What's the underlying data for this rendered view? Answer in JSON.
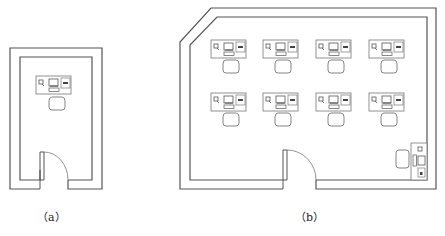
{
  "figure": {
    "panels": [
      {
        "id": "a",
        "label": "（a）",
        "description": "Single-occupant room floor plan with one workstation and a hinged door at bottom",
        "workstations": 1,
        "door": "bottom-left, swing inward-right"
      },
      {
        "id": "b",
        "label": "（b）",
        "description": "Multi-occupant room floor plan with chamfered top-left corner, 8 workstations in 2 rows of 4, a side workstation at bottom-right, and a hinged door at bottom",
        "workstations": 9,
        "rows": 2,
        "columns": 4,
        "door": "bottom-middle, swing inward-right"
      }
    ],
    "colors": {
      "wall": "#555555",
      "furniture": "#777777",
      "background": "#ffffff"
    }
  }
}
